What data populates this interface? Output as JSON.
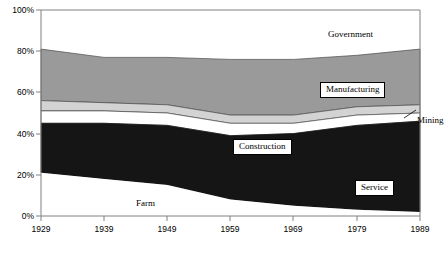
{
  "chart_data": {
    "type": "area",
    "stacked": "percent",
    "title": "",
    "xlabel": "",
    "ylabel": "",
    "x": [
      1929,
      1939,
      1949,
      1959,
      1969,
      1979,
      1989
    ],
    "categories": [
      "1929",
      "1939",
      "1949",
      "1959",
      "1969",
      "1979",
      "1989"
    ],
    "xlim": [
      1929,
      1989
    ],
    "ylim": [
      0,
      100
    ],
    "ytick_labels": [
      "0%",
      "20%",
      "40%",
      "60%",
      "80%",
      "100%"
    ],
    "ytick_values": [
      0,
      20,
      40,
      60,
      80,
      100
    ],
    "grid": false,
    "legend": "in-plot-labels",
    "series": [
      {
        "name": "Farm",
        "values": [
          21,
          18,
          15,
          8,
          5,
          3,
          2
        ],
        "color": "#ffffff",
        "label_box": false
      },
      {
        "name": "Service",
        "values": [
          24,
          27,
          29,
          31,
          35,
          41,
          44
        ],
        "color": "#151515",
        "label_box": true
      },
      {
        "name": "Construction",
        "values": [
          6,
          6,
          6,
          6,
          5,
          5,
          4
        ],
        "color": "#ffffff",
        "label_box": true
      },
      {
        "name": "Mining",
        "values": [
          5,
          4,
          4,
          4,
          4,
          4,
          4
        ],
        "color": "#d3d3d3",
        "label_box": false
      },
      {
        "name": "Manufacturing",
        "values": [
          25,
          22,
          23,
          27,
          27,
          25,
          27
        ],
        "color": "#9a9a9a",
        "label_box": true
      },
      {
        "name": "Government",
        "values": [
          19,
          23,
          23,
          24,
          24,
          22,
          19
        ],
        "color": "#ffffff",
        "label_box": false
      }
    ],
    "annotations": [
      {
        "text": "Government",
        "kind": "plain"
      },
      {
        "text": "Manufacturing",
        "kind": "boxed"
      },
      {
        "text": "Mining",
        "kind": "callout"
      },
      {
        "text": "Construction",
        "kind": "boxed"
      },
      {
        "text": "Service",
        "kind": "boxed"
      },
      {
        "text": "Farm",
        "kind": "plain"
      }
    ]
  },
  "colors": {
    "axis": "#808080",
    "plot_border": "#808080",
    "service_fill": "#151515",
    "manufacturing_fill": "#9a9a9a",
    "mining_fill": "#d3d3d3",
    "white_fill": "#ffffff",
    "text": "#000000"
  },
  "labels": {
    "government": "Government",
    "manufacturing": "Manufacturing",
    "mining": "Mining",
    "construction": "Construction",
    "service": "Service",
    "farm": "Farm"
  },
  "y_axis": {
    "t0": "0%",
    "t20": "20%",
    "t40": "40%",
    "t60": "60%",
    "t80": "80%",
    "t100": "100%"
  },
  "x_axis": {
    "t1929": "1929",
    "t1939": "1939",
    "t1949": "1949",
    "t1959": "1959",
    "t1969": "1969",
    "t1979": "1979",
    "t1989": "1989"
  }
}
